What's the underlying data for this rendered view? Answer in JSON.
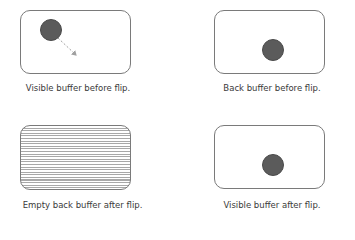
{
  "diagram": {
    "panels": [
      {
        "id": "visible-before",
        "caption": "Visible buffer before flip.",
        "ball": true,
        "motion_arrow": true,
        "empty": false
      },
      {
        "id": "back-before",
        "caption": "Back buffer before flip.",
        "ball": true,
        "motion_arrow": false,
        "empty": false
      },
      {
        "id": "back-after",
        "caption": "Empty back buffer after flip.",
        "ball": false,
        "motion_arrow": false,
        "empty": true
      },
      {
        "id": "visible-after",
        "caption": "Visible buffer after flip.",
        "ball": true,
        "motion_arrow": false,
        "empty": false
      }
    ],
    "colors": {
      "border": "#7a7a7a",
      "ball": "#5b5b5b",
      "arrow": "#a0a0a0",
      "hatch": "#a8a8a8"
    }
  }
}
